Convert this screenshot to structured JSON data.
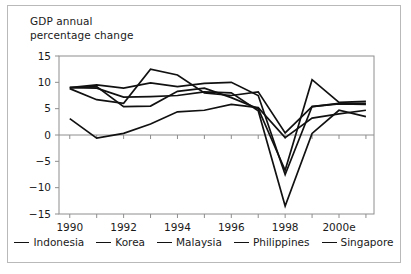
{
  "figure": {
    "title": "GDP annual\npercentage change",
    "border_color": "#b9b9b9"
  },
  "legend": {
    "items": [
      {
        "label": "Indonesia",
        "swatch": "line-swatch-icon"
      },
      {
        "label": "Korea",
        "swatch": "line-swatch-icon"
      },
      {
        "label": "Malaysia",
        "swatch": "line-swatch-icon"
      },
      {
        "label": "Philippines",
        "swatch": "line-swatch-icon"
      },
      {
        "label": "Singapore",
        "swatch": "line-swatch-icon"
      }
    ]
  },
  "chart_data": {
    "type": "line",
    "title": "GDP annual percentage change",
    "xlabel": "",
    "ylabel": "",
    "x": [
      1990,
      1991,
      1992,
      1993,
      1994,
      1995,
      1996,
      1997,
      1998,
      1999,
      2000,
      2001
    ],
    "tick_labels_x": [
      "1990",
      "1992",
      "1994",
      "1996",
      "1998",
      "2000e"
    ],
    "tick_values_x": [
      1990,
      1992,
      1994,
      1996,
      1998,
      2000
    ],
    "tick_labels_y": [
      "15",
      "10",
      "5",
      "0",
      "−5",
      "−10",
      "−15"
    ],
    "tick_values_y": [
      15,
      10,
      5,
      0,
      -5,
      -10,
      -15
    ],
    "xlim": [
      1989.6,
      2001.3
    ],
    "ylim": [
      -15,
      15
    ],
    "grid": false,
    "zero_line": true,
    "legend_position": "bottom",
    "line_color": "#111111",
    "series": [
      {
        "name": "Indonesia",
        "values": [
          9.0,
          8.9,
          7.2,
          7.3,
          7.5,
          8.2,
          8.0,
          4.6,
          -13.5,
          0.3,
          4.7,
          3.5
        ]
      },
      {
        "name": "Korea",
        "values": [
          9.0,
          9.2,
          5.4,
          5.5,
          8.3,
          8.9,
          7.1,
          5.0,
          -6.7,
          10.5,
          6.2,
          6.4
        ]
      },
      {
        "name": "Malaysia",
        "values": [
          9.0,
          9.5,
          8.9,
          9.9,
          9.2,
          9.8,
          10.0,
          7.5,
          -7.5,
          5.4,
          6.0,
          6.0
        ]
      },
      {
        "name": "Philippines",
        "values": [
          3.1,
          -0.6,
          0.3,
          2.1,
          4.4,
          4.7,
          5.8,
          5.2,
          -0.5,
          3.2,
          4.0,
          4.7
        ]
      },
      {
        "name": "Singapore",
        "values": [
          8.8,
          6.7,
          6.0,
          12.5,
          11.4,
          8.0,
          7.5,
          8.2,
          0.4,
          5.4,
          5.9,
          5.8
        ]
      }
    ]
  }
}
